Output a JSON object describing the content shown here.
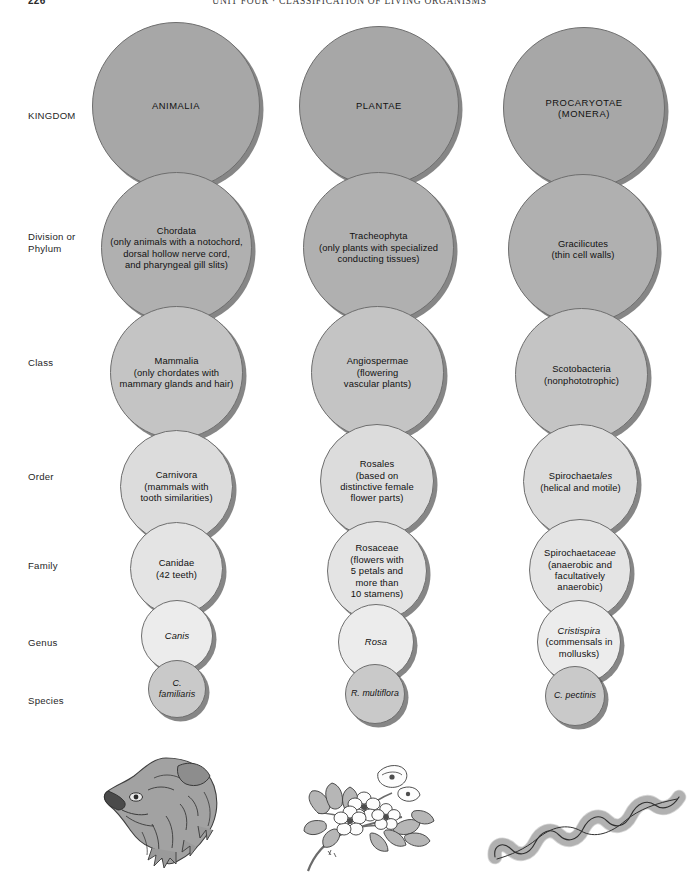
{
  "runhead": {
    "folio": "226",
    "title": "UNIT FOUR  ·  CLASSIFICATION OF LIVING ORGANISMS"
  },
  "ranks": [
    {
      "key": "kingdom",
      "label": "KINGDOM"
    },
    {
      "key": "division",
      "label": "Division or\nPhylum"
    },
    {
      "key": "class",
      "label": "Class"
    },
    {
      "key": "order",
      "label": "Order"
    },
    {
      "key": "family",
      "label": "Family"
    },
    {
      "key": "genus",
      "label": "Genus"
    },
    {
      "key": "species",
      "label": "Species"
    }
  ],
  "columns": [
    {
      "key": "animal",
      "illustration": "dog-head-illustration",
      "nodes": [
        {
          "rank": "kingdom",
          "name": "ANIMALIA",
          "name_style": "caps",
          "desc": ""
        },
        {
          "rank": "division",
          "name": "Chordata",
          "name_style": "roman",
          "desc": "(only animals with a notochord,\ndorsal hollow nerve cord,\nand pharyngeal gill slits)"
        },
        {
          "rank": "class",
          "name": "Mammalia",
          "name_style": "roman",
          "desc": "(only chordates with\nmammary glands and hair)"
        },
        {
          "rank": "order",
          "name": "Carnivora",
          "name_style": "roman",
          "desc": "(mammals with\ntooth similarities)"
        },
        {
          "rank": "family",
          "name": "Canidae",
          "name_style": "roman",
          "desc": "(42 teeth)"
        },
        {
          "rank": "genus",
          "name": "Canis",
          "name_style": "italic",
          "desc": ""
        },
        {
          "rank": "species",
          "name": "C. familiaris",
          "name_style": "italic",
          "desc": ""
        }
      ]
    },
    {
      "key": "plant",
      "illustration": "rose-branch-illustration",
      "nodes": [
        {
          "rank": "kingdom",
          "name": "PLANTAE",
          "name_style": "caps",
          "desc": ""
        },
        {
          "rank": "division",
          "name": "Tracheophyta",
          "name_style": "roman",
          "desc": "(only plants with specialized\nconducting tissues)"
        },
        {
          "rank": "class",
          "name": "Angiospermae",
          "name_style": "roman",
          "desc": "(flowering\nvascular plants)"
        },
        {
          "rank": "order",
          "name": "Rosales",
          "name_style": "roman",
          "desc": "(based on\ndistinctive female\nflower parts)"
        },
        {
          "rank": "family",
          "name": "Rosaceae",
          "name_style": "roman",
          "desc": "(flowers with\n5 petals and\nmore than\n10 stamens)"
        },
        {
          "rank": "genus",
          "name": "Rosa",
          "name_style": "italic",
          "desc": ""
        },
        {
          "rank": "species",
          "name": "R. multiflora",
          "name_style": "italic",
          "desc": ""
        }
      ]
    },
    {
      "key": "monera",
      "illustration": "spirochete-illustration",
      "nodes": [
        {
          "rank": "kingdom",
          "name": "PROCARYOTAE\n(MONERA)",
          "name_style": "caps",
          "desc": ""
        },
        {
          "rank": "division",
          "name": "Gracilicutes",
          "name_style": "roman",
          "desc": "(thin cell walls)"
        },
        {
          "rank": "class",
          "name": "Scotobacteria",
          "name_style": "roman",
          "desc": "(nonphototrophic)"
        },
        {
          "rank": "order",
          "name": "Spirochaetales",
          "name_style": "split",
          "name_roman": "Spirochaet",
          "name_italic": "ales",
          "desc": "(helical and motile)"
        },
        {
          "rank": "family",
          "name": "Spirochaetaceae",
          "name_style": "split",
          "name_roman": "Spirochaet",
          "name_italic": "aceae",
          "desc": "(anaerobic and\nfacultatively\nanaerobic)"
        },
        {
          "rank": "genus",
          "name": "Cristispira",
          "name_style": "italic",
          "desc": "(commensals in\nmollusks)"
        },
        {
          "rank": "species",
          "name": "C. pectinis",
          "name_style": "italic",
          "desc": ""
        }
      ]
    }
  ],
  "colors": {
    "kingdom_fill": "#a7a7a7",
    "division_fill": "#b0b0b0",
    "class_fill": "#c4c4c4",
    "order_fill": "#dcdcdc",
    "family_fill": "#e4e4e4",
    "genus_fill": "#ececec",
    "species_fill": "#c9c9c9",
    "outline": "#6e6e6e",
    "shadow": "#3c3c3c",
    "text": "#111111",
    "page_background": "#ffffff"
  }
}
